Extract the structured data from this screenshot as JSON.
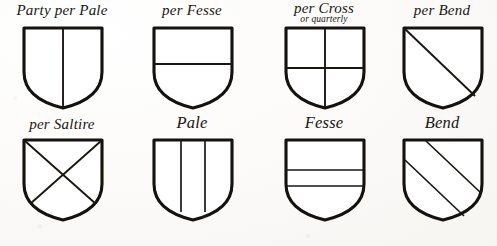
{
  "plate": {
    "title": "Heraldic Divisions of the Field",
    "ink_color": "#14120f",
    "paper_color": "#fbfaf8",
    "rows": 2,
    "columns": 4
  },
  "figures": [
    {
      "id": "party-per-pale",
      "label": "Party per Pale",
      "sublabel": "",
      "charge": "pale-division",
      "description": "Shield divided by a single vertical line"
    },
    {
      "id": "per-fesse",
      "label": "per Fesse",
      "sublabel": "",
      "charge": "fesse-division",
      "description": "Shield divided by a single horizontal line"
    },
    {
      "id": "per-cross",
      "label": "per Cross",
      "sublabel": "or quarterly",
      "charge": "cross-division",
      "description": "Shield divided by a vertical and a horizontal line"
    },
    {
      "id": "per-bend",
      "label": "per Bend",
      "sublabel": "",
      "charge": "bend-division",
      "description": "Shield divided by a single diagonal line"
    },
    {
      "id": "per-saltire",
      "label": "per Saltire",
      "sublabel": "",
      "charge": "saltire-division",
      "description": "Shield divided by two crossing diagonal lines"
    },
    {
      "id": "pale",
      "label": "Pale",
      "sublabel": "",
      "charge": "pale-ordinary",
      "description": "A vertical band down the centre of the shield"
    },
    {
      "id": "fesse",
      "label": "Fesse",
      "sublabel": "",
      "charge": "fesse-ordinary",
      "description": "A horizontal band across the centre of the shield"
    },
    {
      "id": "bend",
      "label": "Bend",
      "sublabel": "",
      "charge": "bend-ordinary",
      "description": "A diagonal band from upper left to lower right"
    }
  ]
}
